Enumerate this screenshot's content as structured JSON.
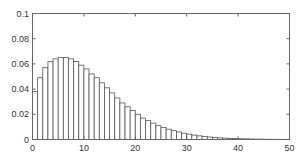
{
  "chart_data": {
    "type": "bar",
    "title": "",
    "xlabel": "",
    "ylabel": "",
    "xlim": [
      0,
      50
    ],
    "ylim": [
      0,
      0.1
    ],
    "grid": false,
    "legend": null,
    "x_ticks": [
      0,
      10,
      20,
      30,
      40,
      50
    ],
    "x_tick_labels": [
      "0",
      "10",
      "20",
      "30",
      "40",
      "50"
    ],
    "y_ticks": [
      0,
      0.02,
      0.04,
      0.06,
      0.08,
      0.1
    ],
    "y_tick_labels": [
      "0",
      "0.02",
      "0.04",
      "0.06",
      "0.08",
      "0.1"
    ],
    "bar_style": {
      "fill": "#ffffff",
      "edge": "#555555",
      "width": 1
    },
    "x": [
      0.5,
      1.5,
      2.5,
      3.5,
      4.5,
      5.5,
      6.5,
      7.5,
      8.5,
      9.5,
      10.5,
      11.5,
      12.5,
      13.5,
      14.5,
      15.5,
      16.5,
      17.5,
      18.5,
      19.5,
      20.5,
      21.5,
      22.5,
      23.5,
      24.5,
      25.5,
      26.5,
      27.5,
      28.5,
      29.5,
      30.5,
      31.5,
      32.5,
      33.5,
      34.5,
      35.5,
      36.5,
      37.5,
      38.5,
      39.5,
      40.5,
      41.5,
      42.5,
      43.5,
      44.5,
      45.5,
      46.5,
      47.5,
      48.5,
      49.5
    ],
    "values": [
      0.038,
      0.049,
      0.057,
      0.062,
      0.064,
      0.065,
      0.065,
      0.064,
      0.062,
      0.059,
      0.056,
      0.052,
      0.049,
      0.045,
      0.041,
      0.037,
      0.033,
      0.029,
      0.026,
      0.023,
      0.02,
      0.017,
      0.015,
      0.013,
      0.011,
      0.0095,
      0.0082,
      0.007,
      0.006,
      0.005,
      0.0042,
      0.0035,
      0.0029,
      0.0024,
      0.002,
      0.0016,
      0.0013,
      0.0011,
      0.0009,
      0.0007,
      0.0006,
      0.0005,
      0.0004,
      0.0003,
      0.00025,
      0.0002,
      0.00015,
      0.0001,
      0.0001,
      0.0001
    ]
  },
  "layout": {
    "plot_left": 32,
    "plot_top": 13,
    "plot_right": 289,
    "plot_bottom": 139
  }
}
